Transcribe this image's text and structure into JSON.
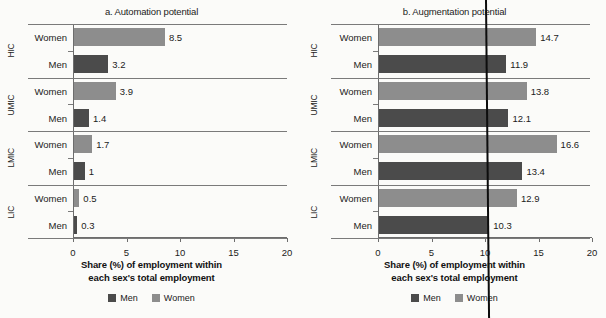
{
  "figure": {
    "axis_caption_line1": "Share (%) of employment within",
    "axis_caption_line2": "each sex's total employment",
    "legend": [
      {
        "label": "Men",
        "color": "#4b4b4b"
      },
      {
        "label": "Women",
        "color": "#8d8d8d"
      }
    ],
    "colors": {
      "men": "#4b4b4b",
      "women": "#8d8d8d",
      "axis": "#6d6d6d",
      "background": "#fbfbf9"
    }
  },
  "chart_data": [
    {
      "type": "bar",
      "orientation": "horizontal",
      "title": "a. Automation potential",
      "xlabel": "Share (%) of employment within each sex's total employment",
      "ylabel": "",
      "xlim": [
        0,
        20
      ],
      "xticks": [
        0,
        5,
        10,
        15,
        20
      ],
      "xticklabels": [
        "0",
        "5",
        "10",
        "15",
        "20"
      ],
      "grid": false,
      "legend_position": "bottom",
      "groups": [
        "HIC",
        "UMIC",
        "LMIC",
        "LIC"
      ],
      "categories": [
        "Women",
        "Men"
      ],
      "series": [
        {
          "name": "Women",
          "color": "#8d8d8d",
          "values": [
            8.5,
            3.9,
            1.7,
            0.5
          ]
        },
        {
          "name": "Men",
          "color": "#4b4b4b",
          "values": [
            3.2,
            1.4,
            1,
            0.3
          ]
        }
      ],
      "rows": [
        {
          "group": "HIC",
          "category": "Women",
          "value": 8.5,
          "label": "8.5"
        },
        {
          "group": "HIC",
          "category": "Men",
          "value": 3.2,
          "label": "3.2"
        },
        {
          "group": "UMIC",
          "category": "Women",
          "value": 3.9,
          "label": "3.9"
        },
        {
          "group": "UMIC",
          "category": "Men",
          "value": 1.4,
          "label": "1.4"
        },
        {
          "group": "LMIC",
          "category": "Women",
          "value": 1.7,
          "label": "1.7"
        },
        {
          "group": "LMIC",
          "category": "Men",
          "value": 1,
          "label": "1"
        },
        {
          "group": "LIC",
          "category": "Women",
          "value": 0.5,
          "label": "0.5"
        },
        {
          "group": "LIC",
          "category": "Men",
          "value": 0.3,
          "label": "0.3"
        }
      ]
    },
    {
      "type": "bar",
      "orientation": "horizontal",
      "title": "b. Augmentation potential",
      "xlabel": "Share (%) of employment within each sex's total employment",
      "ylabel": "",
      "xlim": [
        0,
        20
      ],
      "xticks": [
        0,
        5,
        10,
        15,
        20
      ],
      "xticklabels": [
        "0",
        "5",
        "10",
        "15",
        "20"
      ],
      "grid": false,
      "legend_position": "bottom",
      "groups": [
        "HIC",
        "UMIC",
        "LMIC",
        "LIC"
      ],
      "categories": [
        "Women",
        "Men"
      ],
      "series": [
        {
          "name": "Women",
          "color": "#8d8d8d",
          "values": [
            14.7,
            13.8,
            16.6,
            12.9
          ]
        },
        {
          "name": "Men",
          "color": "#4b4b4b",
          "values": [
            11.9,
            12.1,
            13.4,
            10.3
          ]
        }
      ],
      "rows": [
        {
          "group": "HIC",
          "category": "Women",
          "value": 14.7,
          "label": "14.7"
        },
        {
          "group": "HIC",
          "category": "Men",
          "value": 11.9,
          "label": "11.9"
        },
        {
          "group": "UMIC",
          "category": "Women",
          "value": 13.8,
          "label": "13.8"
        },
        {
          "group": "UMIC",
          "category": "Men",
          "value": 12.1,
          "label": "12.1"
        },
        {
          "group": "LMIC",
          "category": "Women",
          "value": 16.6,
          "label": "16.6"
        },
        {
          "group": "LMIC",
          "category": "Men",
          "value": 13.4,
          "label": "13.4"
        },
        {
          "group": "LIC",
          "category": "Women",
          "value": 12.9,
          "label": "12.9"
        },
        {
          "group": "LIC",
          "category": "Men",
          "value": 10.3,
          "label": "10.3"
        }
      ]
    }
  ]
}
